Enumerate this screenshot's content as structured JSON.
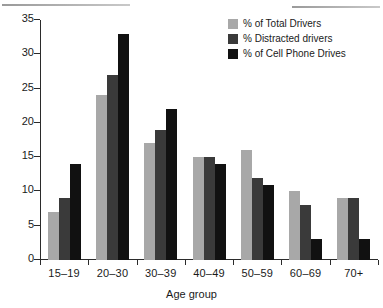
{
  "chart_data": {
    "type": "bar",
    "title": "",
    "xlabel": "Age group",
    "ylabel": "",
    "ylim": [
      0,
      35
    ],
    "ytick_step": 5,
    "yticks": [
      0,
      5,
      10,
      15,
      20,
      25,
      30,
      35
    ],
    "grid": false,
    "legend_position": "top-right",
    "categories": [
      "15–19",
      "20–30",
      "30–39",
      "40–49",
      "50–59",
      "60–69",
      "70+"
    ],
    "series": [
      {
        "name": "% of Total Drivers",
        "color": "#a8a8a8",
        "values": [
          7,
          24,
          17,
          15,
          16,
          10,
          9
        ]
      },
      {
        "name": "% Distracted drivers",
        "color": "#3a3a3a",
        "values": [
          9,
          27,
          19,
          15,
          12,
          8,
          9
        ]
      },
      {
        "name": "% of Cell Phone Drives",
        "color": "#111111",
        "values": [
          14,
          33,
          22,
          14,
          11,
          3,
          3
        ]
      }
    ]
  },
  "axis": {
    "y_labels": [
      "35",
      "30",
      "25",
      "20",
      "15",
      "10",
      "5",
      "0"
    ],
    "x_title": "Age group"
  },
  "colors": {
    "axis": "#2b2b2b",
    "text": "#1a1a1a",
    "background": "#ffffff",
    "rule": "#9a9a9a"
  }
}
